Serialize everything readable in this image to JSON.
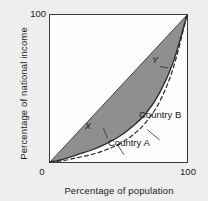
{
  "chart_data": {
    "type": "line",
    "title": "",
    "xlabel": "Percentage of population",
    "ylabel": "Percentage of national income",
    "xlim": [
      0,
      100
    ],
    "ylim": [
      0,
      100
    ],
    "xticks": [
      "0",
      "100"
    ],
    "yticks": [
      "0",
      "100"
    ],
    "grid": false,
    "legend_position": "inline-annotations",
    "series": [
      {
        "name": "Line of equality",
        "style": "solid-thin",
        "color": "#3a3a3a",
        "x": [
          0,
          100
        ],
        "values": [
          0,
          100
        ]
      },
      {
        "name": "Country B",
        "style": "solid",
        "color": "#2a2a2a",
        "x": [
          0,
          10,
          20,
          30,
          40,
          50,
          60,
          70,
          80,
          90,
          100
        ],
        "values": [
          0,
          2,
          5,
          8,
          12,
          17,
          24,
          33,
          47,
          68,
          100
        ]
      },
      {
        "name": "Country A",
        "style": "dashed",
        "color": "#2a2a2a",
        "x": [
          0,
          10,
          20,
          30,
          40,
          50,
          60,
          70,
          80,
          90,
          100
        ],
        "values": [
          0,
          1,
          3,
          5,
          8,
          12,
          18,
          27,
          41,
          64,
          100
        ]
      }
    ],
    "shaded_region": {
      "name": "area of inequality",
      "color": "#8f8f8f",
      "between": [
        "Line of equality",
        "Country B"
      ]
    },
    "annotations": [
      {
        "text": "Country B",
        "target": "Country B curve"
      },
      {
        "text": "Country A",
        "target": "Country A curve"
      },
      {
        "text": "X",
        "target": "lower shaded area"
      },
      {
        "text": "Y",
        "target": "upper shaded area"
      }
    ]
  },
  "axes": {
    "y_title": "Percentage of national income",
    "x_title": "Percentage of population",
    "y_tick_top": "100",
    "x_tick_left": "0",
    "x_tick_right": "100"
  },
  "labels": {
    "country_b": "Country B",
    "country_a": "Country A",
    "marker_x": "X",
    "marker_y": "Y"
  },
  "colors": {
    "page_background": "#eeeeee",
    "plot_background": "#fdfdfd",
    "frame": "#3a3a3a",
    "shade": "#8f8f8f",
    "curve": "#2a2a2a",
    "text": "#1a1a1a"
  }
}
